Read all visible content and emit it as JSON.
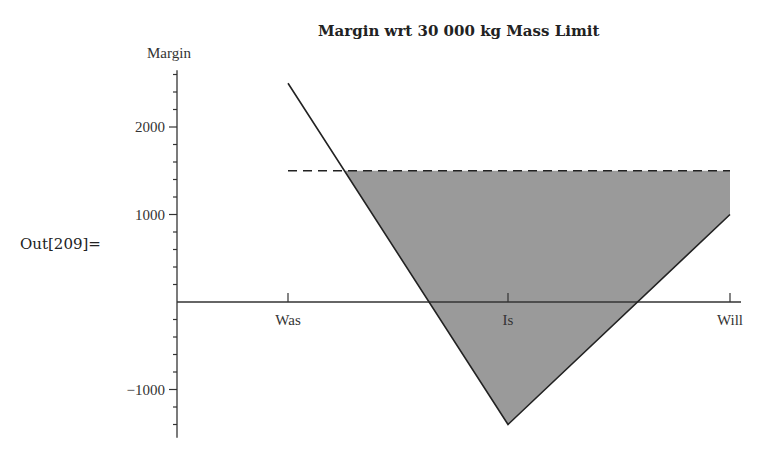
{
  "output_label": "Out[209]=",
  "chart_data": {
    "type": "line",
    "title": "Margin wrt 30 000 kg Mass Limit",
    "xlabel": "",
    "ylabel": "Margin",
    "categories": [
      "Was",
      "Is",
      "Will"
    ],
    "series": [
      {
        "name": "Margin",
        "style": "solid",
        "values": [
          2500,
          -1400,
          1000
        ]
      },
      {
        "name": "Reference",
        "style": "dashed",
        "values": [
          1500,
          1500,
          1500
        ]
      }
    ],
    "shaded_region": "area between dashed reference line and margin line where margin is below reference",
    "ylim": [
      -1550,
      2650
    ],
    "yticks_major": [
      -1000,
      1000,
      2000
    ],
    "ytick_labels": [
      "−1000",
      "1000",
      "2000"
    ],
    "ytick_minor_step": 200,
    "grid": false,
    "legend": "none",
    "colors": {
      "line": "#222222",
      "shade": "#9a9a9a",
      "axis": "#333333"
    }
  }
}
